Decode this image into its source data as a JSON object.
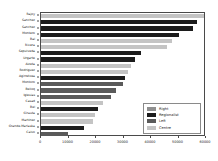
{
  "chart_data": {
    "type": "bar",
    "orientation": "horizontal",
    "title": "",
    "xlabel": "",
    "ylabel": "",
    "xlim": [
      0,
      60000
    ],
    "xticks": [
      0,
      10000,
      20000,
      30000,
      40000,
      50000,
      60000
    ],
    "xtick_labels": [
      "0",
      "10000",
      "20000",
      "30000",
      "40000",
      "50000",
      "60000"
    ],
    "grid": false,
    "legend_position": "lower right",
    "legend": [
      {
        "label": "Right",
        "color": "#909090"
      },
      {
        "label": "Regionalist",
        "color": "#1c1c1c"
      },
      {
        "label": "Left",
        "color": "#5a5a5a"
      },
      {
        "label": "Centre",
        "color": "#c4c4c4"
      }
    ],
    "categories": [
      "Rajoy",
      "Sanchez",
      "Sanchez",
      "Montero",
      "Bal",
      "Rivera",
      "Sepulveda",
      "Urgarte",
      "Aizeta",
      "Rodriguez",
      "Agirretxea",
      "Montoro",
      "Belloq",
      "Iglesias",
      "Casad",
      "Bel",
      "Girauta",
      "Martinez",
      "Grande-Marlaska",
      "Calvo"
    ],
    "values": [
      59200,
      56800,
      55400,
      50100,
      47800,
      45900,
      36200,
      34100,
      32900,
      31800,
      30600,
      29800,
      27400,
      25300,
      22700,
      20900,
      19500,
      18800,
      15600,
      9800
    ],
    "groups": [
      "Centre",
      "Regionalist",
      "Regionalist",
      "Regionalist",
      "Centre",
      "Centre",
      "Regionalist",
      "Regionalist",
      "Centre",
      "Centre",
      "Regionalist",
      "Left",
      "Left",
      "Left",
      "Centre",
      "Regionalist",
      "Centre",
      "Centre",
      "Regionalist",
      "Left"
    ]
  }
}
